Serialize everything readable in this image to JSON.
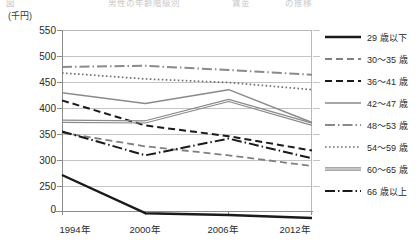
{
  "header": {
    "cropped_row": [
      "図",
      "表",
      "男性の年齢階級別",
      "賃金",
      "の推移"
    ]
  },
  "axis": {
    "unit_label": "(千円)",
    "y_ticks": [
      "550",
      "500",
      "450",
      "400",
      "350",
      "300",
      "250",
      "0"
    ],
    "x_ticks": [
      "1994年",
      "2000年",
      "2006年",
      "2012年"
    ]
  },
  "legend": {
    "items": [
      {
        "label": "29 歳以下",
        "style": "solid-thick-black",
        "color": "#1a1a1a"
      },
      {
        "label": "30～35 歳",
        "style": "dashed-gray",
        "color": "#7d7d7d"
      },
      {
        "label": "36～41 歳",
        "style": "dashed-black",
        "color": "#1a1a1a"
      },
      {
        "label": "42～47 歳",
        "style": "solid-gray",
        "color": "#8a8a8a"
      },
      {
        "label": "48～53 歳",
        "style": "dashdot-gray",
        "color": "#8a8a8a"
      },
      {
        "label": "54～59 歳",
        "style": "dotted-gray",
        "color": "#6f6f6f"
      },
      {
        "label": "60～65 歳",
        "style": "double-gray",
        "color": "#8a8a8a"
      },
      {
        "label": "66 歳以上",
        "style": "dashdot-black",
        "color": "#1a1a1a"
      }
    ]
  },
  "chart_data": {
    "type": "line",
    "title": "",
    "xlabel": "",
    "ylabel": "(千円)",
    "categories": [
      "1994年",
      "2000年",
      "2006年",
      "2012年"
    ],
    "ylim": [
      250,
      550
    ],
    "y_axis_break_to_zero": true,
    "grid": true,
    "legend_position": "right",
    "series": [
      {
        "name": "29 歳以下",
        "values": [
          307,
          243,
          240,
          235
        ]
      },
      {
        "name": "30～35 歳",
        "values": [
          378,
          355,
          340,
          322
        ]
      },
      {
        "name": "36～41 歳",
        "values": [
          432,
          390,
          372,
          348
        ]
      },
      {
        "name": "42～47 歳",
        "values": [
          445,
          427,
          450,
          395
        ]
      },
      {
        "name": "48～53 歳",
        "values": [
          488,
          490,
          483,
          475
        ]
      },
      {
        "name": "54～59 歳",
        "values": [
          478,
          468,
          462,
          450
        ]
      },
      {
        "name": "60～65 歳",
        "values": [
          397,
          396,
          432,
          392
        ]
      },
      {
        "name": "66 歳以上",
        "values": [
          380,
          340,
          368,
          335
        ]
      }
    ]
  }
}
